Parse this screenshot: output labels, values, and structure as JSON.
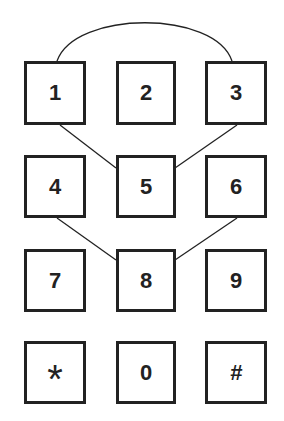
{
  "keypad": {
    "keys": [
      {
        "label": "1",
        "row": 0,
        "col": 0
      },
      {
        "label": "2",
        "row": 0,
        "col": 1
      },
      {
        "label": "3",
        "row": 0,
        "col": 2
      },
      {
        "label": "4",
        "row": 1,
        "col": 0
      },
      {
        "label": "5",
        "row": 1,
        "col": 1
      },
      {
        "label": "6",
        "row": 1,
        "col": 2
      },
      {
        "label": "7",
        "row": 2,
        "col": 0
      },
      {
        "label": "8",
        "row": 2,
        "col": 1
      },
      {
        "label": "9",
        "row": 2,
        "col": 2
      },
      {
        "label": "*",
        "row": 3,
        "col": 0
      },
      {
        "label": "0",
        "row": 3,
        "col": 1
      },
      {
        "label": "#",
        "row": 3,
        "col": 2
      }
    ],
    "connections": [
      {
        "from": "1",
        "to": "3",
        "shape": "arc"
      },
      {
        "from": "1",
        "to": "5",
        "shape": "line"
      },
      {
        "from": "3",
        "to": "5",
        "shape": "line"
      },
      {
        "from": "4",
        "to": "8",
        "shape": "line"
      },
      {
        "from": "6",
        "to": "8",
        "shape": "line"
      }
    ],
    "colors": {
      "stroke": "#222222",
      "background": "#ffffff"
    }
  }
}
